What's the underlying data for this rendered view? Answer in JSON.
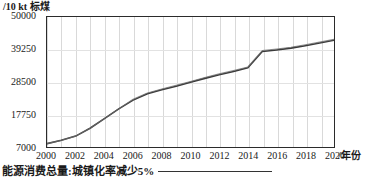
{
  "chart_data": {
    "type": "line",
    "title": "",
    "ylabel": "/10 kt 标煤",
    "xlabel": "/年份",
    "grid": true,
    "legend_position": "bottom-left",
    "xlim": [
      2000,
      2020
    ],
    "ylim": [
      7000,
      50000
    ],
    "yticks": [
      7000,
      17750,
      28500,
      39250,
      50000
    ],
    "xticks": [
      2000,
      2002,
      2004,
      2006,
      2008,
      2010,
      2012,
      2014,
      2016,
      2018,
      2020
    ],
    "x": [
      2000,
      2001,
      2002,
      2003,
      2004,
      2005,
      2006,
      2007,
      2008,
      2009,
      2010,
      2011,
      2012,
      2013,
      2014,
      2015,
      2016,
      2017,
      2018,
      2019,
      2020
    ],
    "series": [
      {
        "name": "能源消费总量:城镇化率减少5%",
        "color": "#3a3a3a",
        "values": [
          8100,
          9200,
          10600,
          13200,
          16400,
          19600,
          22500,
          24600,
          25900,
          27100,
          28400,
          29700,
          30900,
          32000,
          33200,
          38600,
          39100,
          39700,
          40500,
          41400,
          42300
        ]
      }
    ],
    "annotations": []
  },
  "axes": {
    "y_unit_label": "/10 kt 标煤",
    "x_unit_label": "/年份",
    "y_tick_labels": [
      "50000",
      "39250",
      "28500",
      "17750",
      "7000"
    ],
    "x_tick_labels": [
      "2000",
      "2002",
      "2004",
      "2006",
      "2008",
      "2010",
      "2012",
      "2014",
      "2016",
      "2018",
      "2020"
    ]
  },
  "legend": {
    "label": "能源消费总量:城镇化率减少5%",
    "line_color": "#333333"
  },
  "colors": {
    "frame": "#2b2b2b",
    "grid": "#d9d9d9",
    "series": "#3a3a3a",
    "background": "#ffffff"
  }
}
